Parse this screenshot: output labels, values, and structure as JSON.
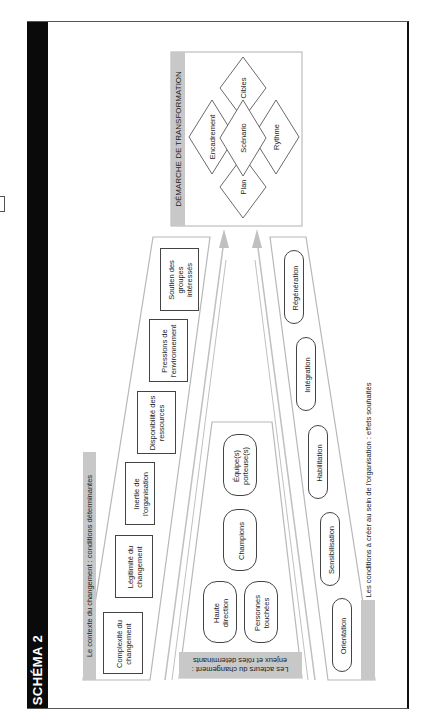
{
  "title": "SCHÉMA 2",
  "transformation": {
    "header": "DÉMARCHE DE TRANSFORMATION",
    "diamonds": [
      "Encadrement",
      "Cibles",
      "Scénario",
      "Rythme",
      "Plan"
    ]
  },
  "context": {
    "label": "Le contexte du changement : conditions déterminantes",
    "items": [
      "Complexité du changement",
      "Légitimité du changement",
      "Inertie de l'organisation",
      "Disponibilité des ressources",
      "Pressions de l'environnement",
      "Soutien des groupes intéressés"
    ]
  },
  "actors": {
    "label": "Les acteurs du changement : enjeux et rôles déterminants",
    "items": [
      "Haute direction",
      "Personnes touchées",
      "Champions",
      "Équipe(s) porteuse(s)"
    ]
  },
  "conditions": {
    "label": "Les conditions à créer au sein de l'organisation : effets souhaités",
    "items": [
      "Orientation",
      "Sensibilisation",
      "Habilitation",
      "Intégration",
      "Régénération"
    ]
  },
  "colors": {
    "strip": "#c8c8c8",
    "trapezoid_border": "#b8b8b8",
    "arrow": "#c0c0c0",
    "title_bar": "#0a0a0a"
  }
}
